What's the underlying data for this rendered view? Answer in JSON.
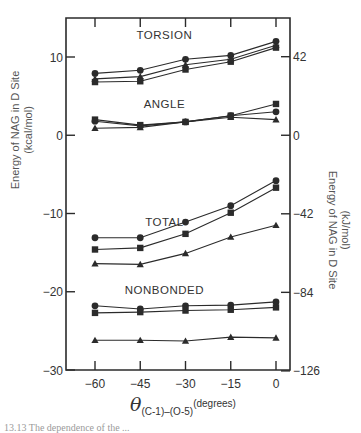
{
  "chart_data": {
    "type": "line",
    "title": "",
    "xlabel": "θ(C-1)–(O-5) (degrees)",
    "xlabel_parts": {
      "symbol": "θ",
      "subscript": "(C-1)–(O-5)",
      "unit": "(degrees)"
    },
    "ylabel": "Energy of NAG in D Site (kcal/mol)",
    "ylabel_line1": "Energy of NAG in D Site",
    "ylabel_line2": "(kcal/mol)",
    "ylabel_right": "Energy of NAG in D Site (kJ/mol)",
    "ylabel_right_line1": "Energy of NAG in D Site",
    "ylabel_right_line2": "(kJ/mol)",
    "x": [
      -60,
      -45,
      -30,
      -15,
      0
    ],
    "x_tick_labels": [
      "−60",
      "−45",
      "−30",
      "−15",
      "0"
    ],
    "xlim": [
      -66,
      5
    ],
    "ylim": [
      -30,
      16
    ],
    "y_ticks_left": [
      10,
      0,
      -10,
      -20,
      -30
    ],
    "y_tick_labels_left": [
      "10",
      "0",
      "−10",
      "−20",
      "−30"
    ],
    "y_ticks_right": [
      42,
      0,
      -42,
      -84,
      -126
    ],
    "y_tick_labels_right": [
      "42",
      "0",
      "−42",
      "−84",
      "−126"
    ],
    "grid": false,
    "legend": null,
    "marker_legend": {
      "circle": "series 1",
      "square": "series 2",
      "triangle": "series 3"
    },
    "groups": [
      {
        "name": "TORSION",
        "label_pos": {
          "x": -37,
          "y": 12.3
        },
        "series": [
          {
            "marker": "circle",
            "values": [
              7.9,
              8.3,
              9.7,
              10.2,
              12.0
            ]
          },
          {
            "marker": "triangle",
            "values": [
              7.2,
              7.5,
              9.0,
              9.7,
              11.5
            ]
          },
          {
            "marker": "square",
            "values": [
              6.8,
              6.9,
              8.4,
              9.4,
              11.2
            ]
          }
        ]
      },
      {
        "name": "ANGLE",
        "label_pos": {
          "x": -37,
          "y": 3.5
        },
        "series": [
          {
            "marker": "square",
            "values": [
              2.0,
              1.3,
              1.7,
              2.5,
              4.0
            ]
          },
          {
            "marker": "circle",
            "values": [
              1.8,
              1.2,
              1.7,
              2.5,
              3.0
            ]
          },
          {
            "marker": "triangle",
            "values": [
              0.9,
              1.0,
              1.7,
              2.3,
              2.0
            ]
          }
        ]
      },
      {
        "name": "TOTAL",
        "label_pos": {
          "x": -37,
          "y": -11.6
        },
        "series": [
          {
            "marker": "circle",
            "values": [
              -13.1,
              -13.1,
              -11.1,
              -9.0,
              -5.8
            ]
          },
          {
            "marker": "square",
            "values": [
              -14.6,
              -14.4,
              -12.6,
              -9.9,
              -6.7
            ]
          },
          {
            "marker": "triangle",
            "values": [
              -16.4,
              -16.5,
              -15.1,
              -13.0,
              -11.5
            ]
          }
        ]
      },
      {
        "name": "NONBONDED",
        "label_pos": {
          "x": -37,
          "y": -20.3
        },
        "series": [
          {
            "marker": "circle",
            "values": [
              -21.8,
              -22.2,
              -21.8,
              -21.7,
              -21.3
            ]
          },
          {
            "marker": "square",
            "values": [
              -22.7,
              -22.6,
              -22.4,
              -22.3,
              -22.0
            ]
          },
          {
            "marker": "triangle",
            "values": [
              -26.2,
              -26.2,
              -26.3,
              -25.8,
              -25.9
            ]
          }
        ]
      }
    ]
  },
  "caption": "13.13  The dependence of the ..."
}
